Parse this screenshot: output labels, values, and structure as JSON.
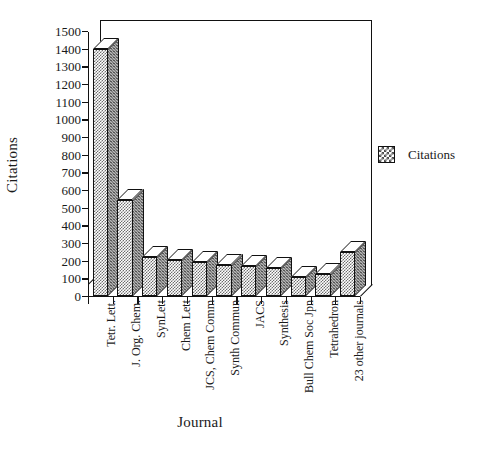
{
  "chart_data": {
    "type": "bar",
    "title": "",
    "xlabel": "Journal",
    "ylabel": "Citations",
    "categories": [
      "Tetr. Lett.",
      "J. Org. Chem.",
      "SynLett",
      "Chem Lett",
      "JCS, Chem Comm",
      "Synth Commun",
      "JACS",
      "Synthesis",
      "Bull Chem Soc Jpn",
      "Tetrahedron",
      "23 other journals"
    ],
    "values": [
      1400,
      545,
      220,
      205,
      195,
      175,
      170,
      160,
      110,
      125,
      250
    ],
    "series": [
      {
        "name": "Citations",
        "values": [
          1400,
          545,
          220,
          205,
          195,
          175,
          170,
          160,
          110,
          125,
          250
        ]
      }
    ],
    "ylim": [
      0,
      1500
    ],
    "ytick_step": 100,
    "ytick_labels": [
      "0",
      "100",
      "200",
      "300",
      "400",
      "500",
      "600",
      "700",
      "800",
      "900",
      "1000",
      "1100",
      "1200",
      "1300",
      "1400",
      "1500"
    ],
    "grid": false,
    "legend_position": "right",
    "legend_entries": [
      "Citations"
    ],
    "style": "3d-bar"
  },
  "legend": {
    "swatch_name": "dotted-pattern-swatch",
    "label": "Citations"
  },
  "colors": {
    "bar_front": "#ffffff",
    "bar_pattern": "#6e6e6e",
    "bar_side": "#b9b9b9",
    "outline": "#111111",
    "text": "#1a1a1a",
    "background": "#ffffff"
  }
}
